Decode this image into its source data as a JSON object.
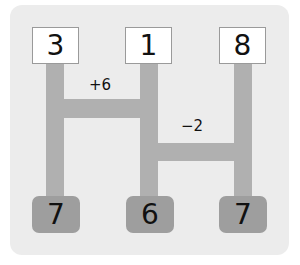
{
  "diagram": {
    "type": "ladder (amidakuji) puzzle",
    "top_numbers": [
      "3",
      "1",
      "8"
    ],
    "bottom_numbers": [
      "7",
      "6",
      "7"
    ],
    "rungs": [
      {
        "between": [
          0,
          1
        ],
        "label": "+6"
      },
      {
        "between": [
          1,
          2
        ],
        "label": "−2"
      }
    ],
    "colors": {
      "panel": "#ececec",
      "bar": "#b0b0b0",
      "bottom_box": "#9e9e9e",
      "top_box": "#ffffff"
    }
  }
}
